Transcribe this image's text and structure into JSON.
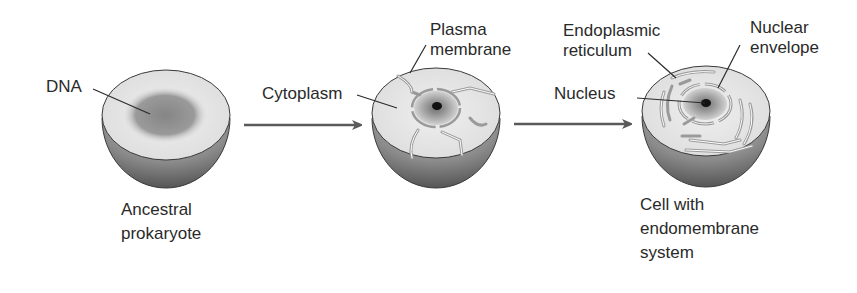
{
  "colors": {
    "text": "#2a2a2a",
    "line": "#2b2b2b",
    "arrow": "#5a5a5a",
    "cut_face": "#e6e6e6",
    "shell_light": "#b5b5b5",
    "shell_dark": "#4f4f4f",
    "dna_region": "#8e8e8e",
    "nucleolus": "#111111"
  },
  "stages": [
    {
      "id": "ancestral-prokaryote",
      "caption": [
        "Ancestral",
        "prokaryote"
      ],
      "labels": [
        {
          "text": "DNA"
        }
      ]
    },
    {
      "id": "intermediate-cell",
      "labels": [
        {
          "text": "Cytoplasm"
        },
        {
          "lines": [
            "Plasma",
            "membrane"
          ]
        }
      ]
    },
    {
      "id": "cell-with-endomembrane-system",
      "caption": [
        "Cell with",
        "endomembrane",
        "system"
      ],
      "labels": [
        {
          "lines": [
            "Endoplasmic",
            "reticulum"
          ]
        },
        {
          "lines": [
            "Nuclear",
            "envelope"
          ]
        },
        {
          "text": "Nucleus"
        }
      ]
    }
  ],
  "arrows": [
    {
      "from": "ancestral-prokaryote",
      "to": "intermediate-cell"
    },
    {
      "from": "intermediate-cell",
      "to": "cell-with-endomembrane-system"
    }
  ]
}
